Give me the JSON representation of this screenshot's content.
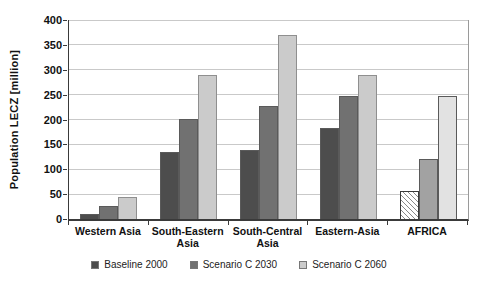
{
  "chart_data": {
    "type": "bar",
    "title": "",
    "ylabel": "Population LECZ [million]",
    "xlabel": "",
    "ylim": [
      0,
      400
    ],
    "ytick_step": 50,
    "grid": true,
    "legend_position": "bottom",
    "categories": [
      "Western Asia",
      "South-Eastern Asia",
      "South-Central Asia",
      "Eastern-Asia",
      "AFRICA"
    ],
    "series": [
      {
        "name": "Baseline 2000",
        "color": "#4d4d4d",
        "values": [
          10,
          135,
          138,
          182,
          56
        ]
      },
      {
        "name": "Scenario C 2030",
        "color": "#717171",
        "values": [
          26,
          200,
          227,
          247,
          120
        ]
      },
      {
        "name": "Scenario C 2060",
        "color": "#cbcbcb",
        "values": [
          45,
          290,
          370,
          290,
          248
        ]
      }
    ],
    "africa_bar_styles": [
      {
        "pattern": "diagonal-hatch",
        "background": "#ffffff",
        "stripe": "#8a8a8a"
      },
      {
        "pattern": "solid",
        "background": "#a2a2a2"
      },
      {
        "pattern": "solid",
        "background": "#e2e2e2"
      }
    ],
    "colors": {
      "axis": "#3a3a3a",
      "grid": "#c9c9c9",
      "background": "#ffffff"
    }
  }
}
